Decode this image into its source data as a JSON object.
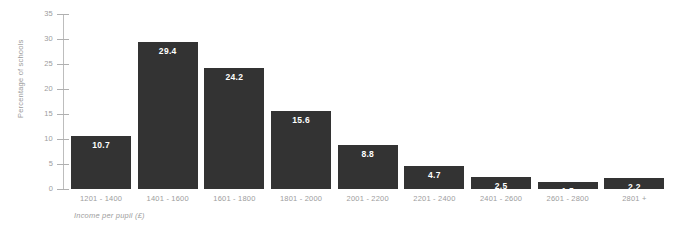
{
  "chart_data": {
    "type": "bar",
    "title": "",
    "xlabel": "Income per pupil (£)",
    "ylabel": "Percentage of schools",
    "categories": [
      "1201 - 1400",
      "1401 - 1600",
      "1601 - 1800",
      "1801 - 2000",
      "2001 - 2200",
      "2201 - 2400",
      "2401 - 2600",
      "2601 - 2800",
      "2801 +"
    ],
    "values": [
      10.7,
      29.4,
      24.2,
      15.6,
      8.8,
      4.7,
      2.5,
      1.5,
      2.2
    ],
    "value_labels": [
      "10.7",
      "29.4",
      "24.2",
      "15.6",
      "8.8",
      "4.7",
      "2.5",
      "1.5",
      "2.2"
    ],
    "ylim": [
      0,
      35
    ],
    "ytick_values": [
      0,
      5,
      10,
      15,
      20,
      25,
      30,
      35
    ],
    "ytick_labels": [
      "0",
      "5",
      "10",
      "15",
      "20",
      "25",
      "30",
      "35"
    ],
    "grid": false,
    "legend": null,
    "bar_color": "#333333",
    "value_label_color": "#ffffff",
    "axis_text_color": "#9d9d9d",
    "axis_line_color": "#bdbdbd",
    "background": "#ffffff"
  }
}
